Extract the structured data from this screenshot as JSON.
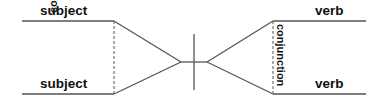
{
  "diagram": {
    "type": "sentence-diagram",
    "left": {
      "top_word": "subject",
      "bottom_word": "subject",
      "connector": "conjunction"
    },
    "right": {
      "top_word": "verb",
      "bottom_word": "verb",
      "connector": "conjunction"
    },
    "colors": {
      "line": "#555555",
      "text": "#111111",
      "background": "#ffffff"
    }
  }
}
